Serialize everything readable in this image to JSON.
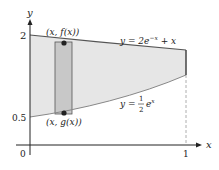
{
  "figure": {
    "axes": {
      "x_label": "x",
      "y_label": "y",
      "origin_label": "0",
      "x_tick_1": "1",
      "y_tick_2": "2",
      "y_tick_half": "0.5"
    },
    "curves": {
      "top": {
        "label_y": "y = 2e",
        "label_exp": "−x",
        "label_rest": " + x"
      },
      "bottom": {
        "label_y": "y = ",
        "frac_num": "1",
        "frac_den": "2",
        "label_e": "e",
        "label_exp": "x"
      }
    },
    "points": {
      "top": "(x, f(x))",
      "bottom": "(x, g(x))"
    },
    "colors": {
      "region_fill": "#e6e6e6",
      "strip_fill": "#c8c8c8",
      "curve_stroke": "#555555",
      "axis_stroke": "#222222"
    }
  }
}
